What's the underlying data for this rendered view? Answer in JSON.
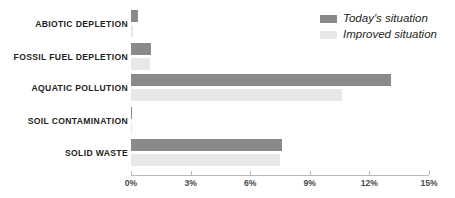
{
  "chart_data": {
    "type": "bar",
    "orientation": "horizontal",
    "title": "",
    "xlabel": "",
    "ylabel": "",
    "xlim": [
      0,
      15
    ],
    "xtick_labels": [
      "0%",
      "3%",
      "6%",
      "9%",
      "12%",
      "15%"
    ],
    "xtick_values": [
      0,
      3,
      6,
      9,
      12,
      15
    ],
    "grid": false,
    "legend_position": "top-right",
    "categories": [
      "ABIOTIC DEPLETION",
      "FOSSIL FUEL DEPLETION",
      "AQUATIC POLLUTION",
      "SOIL CONTAMINATION",
      "SOLID WASTE"
    ],
    "series": [
      {
        "name": "Today's situation",
        "color": "#8a8a8a",
        "values": [
          0.35,
          1.0,
          13.1,
          0.05,
          7.6
        ]
      },
      {
        "name": "Improved situation",
        "color": "#e8e8e8",
        "values": [
          0.1,
          0.95,
          10.6,
          0.03,
          7.5
        ]
      }
    ]
  },
  "legend": {
    "items": [
      {
        "label": "Today's situation",
        "color": "#8a8a8a"
      },
      {
        "label": "Improved situation",
        "color": "#e8e8e8"
      }
    ]
  },
  "axis": {
    "line_color": "#b9b9b9",
    "tick_color": "#b9b9b9",
    "label_color": "#4a4a4a"
  }
}
